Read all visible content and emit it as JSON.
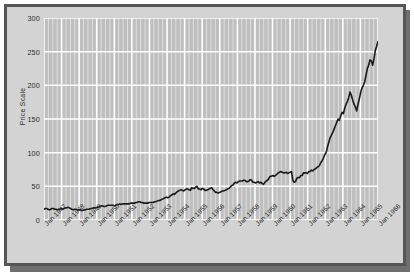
{
  "chart_data": {
    "type": "line",
    "title": "",
    "xlabel": "",
    "ylabel": "Price Scale",
    "ylim": [
      0,
      300
    ],
    "yticks": [
      0,
      50,
      100,
      150,
      200,
      250,
      300
    ],
    "ytick_labels": [
      "0",
      "50",
      "100",
      "150",
      "200",
      "250",
      "300"
    ],
    "grid": true,
    "legend": "none",
    "xtick_labels": [
      "Jan 1947",
      "Jan 1948",
      "Jan 1949",
      "Jan 1950",
      "Jan 1951",
      "Jan 1952",
      "Jan 1953",
      "Jan 1954",
      "Jan 1955",
      "Jan 1956",
      "Jan 1957",
      "Jan 1958",
      "Jan 1959",
      "Jan 1960",
      "Jan 1961",
      "Jan 1962",
      "Jan 1963",
      "Jan 1964",
      "Jan 1965",
      "Jan 1966"
    ],
    "x_start": "Jan 1947",
    "x_end": "Jan 1966",
    "x_interval": "monthly",
    "series": [
      {
        "name": "Price Scale",
        "color": "#1a1a1a",
        "values": [
          16,
          17,
          17,
          16,
          15,
          16,
          17,
          17,
          16,
          16,
          15,
          16,
          16,
          17,
          16,
          17,
          18,
          18,
          19,
          18,
          17,
          16,
          15,
          16,
          16,
          15,
          15,
          15,
          14,
          14,
          15,
          15,
          16,
          16,
          16,
          17,
          17,
          18,
          18,
          18,
          19,
          19,
          20,
          21,
          21,
          20,
          20,
          21,
          22,
          22,
          22,
          22,
          22,
          21,
          22,
          23,
          23,
          24,
          23,
          24,
          24,
          24,
          24,
          24,
          24,
          25,
          25,
          25,
          25,
          26,
          26,
          27,
          27,
          26,
          26,
          25,
          25,
          25,
          25,
          26,
          26,
          26,
          26,
          27,
          27,
          28,
          29,
          29,
          30,
          31,
          32,
          33,
          34,
          33,
          34,
          36,
          37,
          39,
          38,
          40,
          42,
          43,
          44,
          45,
          44,
          43,
          45,
          46,
          46,
          45,
          44,
          48,
          47,
          47,
          49,
          50,
          46,
          46,
          45,
          47,
          46,
          44,
          44,
          45,
          46,
          47,
          48,
          45,
          43,
          41,
          41,
          40,
          41,
          42,
          43,
          43,
          44,
          45,
          46,
          47,
          49,
          51,
          52,
          55,
          56,
          55,
          57,
          58,
          58,
          58,
          59,
          59,
          57,
          57,
          58,
          60,
          59,
          56,
          56,
          55,
          56,
          57,
          55,
          56,
          54,
          53,
          56,
          58,
          59,
          62,
          65,
          65,
          66,
          65,
          66,
          68,
          70,
          71,
          72,
          71,
          70,
          70,
          71,
          69,
          70,
          71,
          72,
          59,
          56,
          57,
          62,
          63,
          63,
          66,
          66,
          70,
          70,
          70,
          69,
          72,
          72,
          74,
          73,
          75,
          76,
          78,
          79,
          81,
          85,
          88,
          92,
          97,
          100,
          108,
          115,
          122,
          126,
          130,
          135,
          140,
          145,
          150,
          148,
          155,
          160,
          158,
          166,
          172,
          176,
          182,
          190,
          185,
          178,
          172,
          168,
          162,
          172,
          180,
          190,
          196,
          200,
          205,
          215,
          225,
          230,
          238,
          236,
          230,
          240,
          252,
          258,
          265
        ]
      }
    ]
  }
}
